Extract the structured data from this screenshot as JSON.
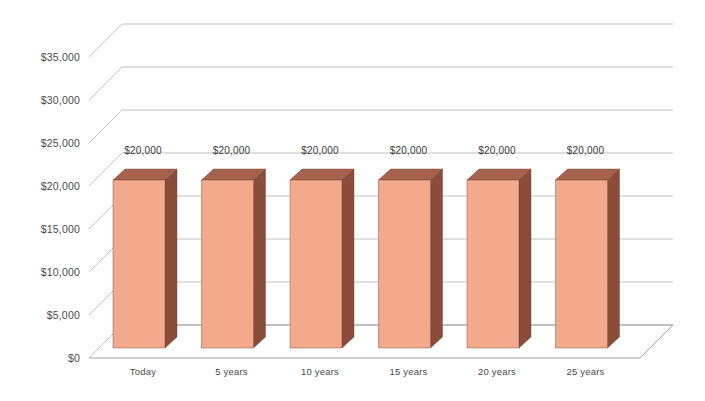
{
  "chart_data": {
    "type": "bar",
    "title": "",
    "subtitle": "",
    "xlabel": "",
    "ylabel": "",
    "categories": [
      "Today",
      "5 years",
      "10 years",
      "15 years",
      "20 years",
      "25 years"
    ],
    "values": [
      20000,
      20000,
      20000,
      20000,
      20000,
      20000
    ],
    "data_labels": [
      "$20,000",
      "$20,000",
      "$20,000",
      "$20,000",
      "$20,000",
      "$20,000"
    ],
    "ylim": [
      0,
      35000
    ],
    "ytick_values": [
      0,
      5000,
      10000,
      15000,
      20000,
      25000,
      30000,
      35000
    ],
    "ytick_labels": [
      "$0",
      "$5,000",
      "$10,000",
      "$15,000",
      "$20,000",
      "$25,000",
      "$30,000",
      "$35,000"
    ],
    "grid": true,
    "legend": false,
    "legend_position": "none",
    "three_d": true,
    "series": [
      {
        "name": "Value",
        "values": [
          20000,
          20000,
          20000,
          20000,
          20000,
          20000
        ],
        "front_color": "#f2a98c",
        "side_color": "#8c4c3a",
        "top_color": "#a5634d"
      }
    ],
    "colors": {
      "bar_front": "#f2a98c",
      "bar_side": "#8c4c3a",
      "bar_top": "#a5634d",
      "gridline": "#b9b9b9",
      "axis_text": "#4a4a4a",
      "background": "#ffffff"
    }
  }
}
